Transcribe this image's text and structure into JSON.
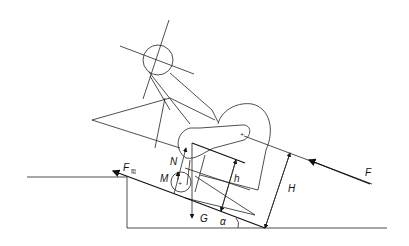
{
  "diagram": {
    "title": "",
    "labels": {
      "F_resist": "F",
      "F_resist_sub": "阻",
      "N": "N",
      "M": "M",
      "G": "G",
      "h": "h",
      "H": "H",
      "F": "F",
      "alpha": "α"
    },
    "colors": {
      "line": "#222222",
      "background": "#ffffff"
    }
  }
}
